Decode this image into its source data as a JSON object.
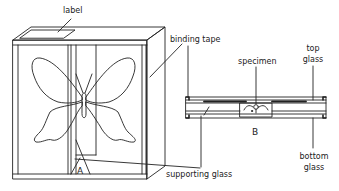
{
  "figure": {
    "panels": [
      {
        "id": "A",
        "letter": "A",
        "description": "specimen box with butterfly, front perspective view"
      },
      {
        "id": "B",
        "letter": "B",
        "description": "cross-section of glass mount with specimen"
      }
    ],
    "labels": {
      "label": "label",
      "binding_tape": "binding tape",
      "specimen": "specimen",
      "top_glass_1": "top",
      "top_glass_2": "glass",
      "bottom_glass_1": "bottom",
      "bottom_glass_2": "glass",
      "supporting_glass": "supporting glass"
    },
    "colors": {
      "line": "#222222",
      "background": "#ffffff"
    }
  }
}
